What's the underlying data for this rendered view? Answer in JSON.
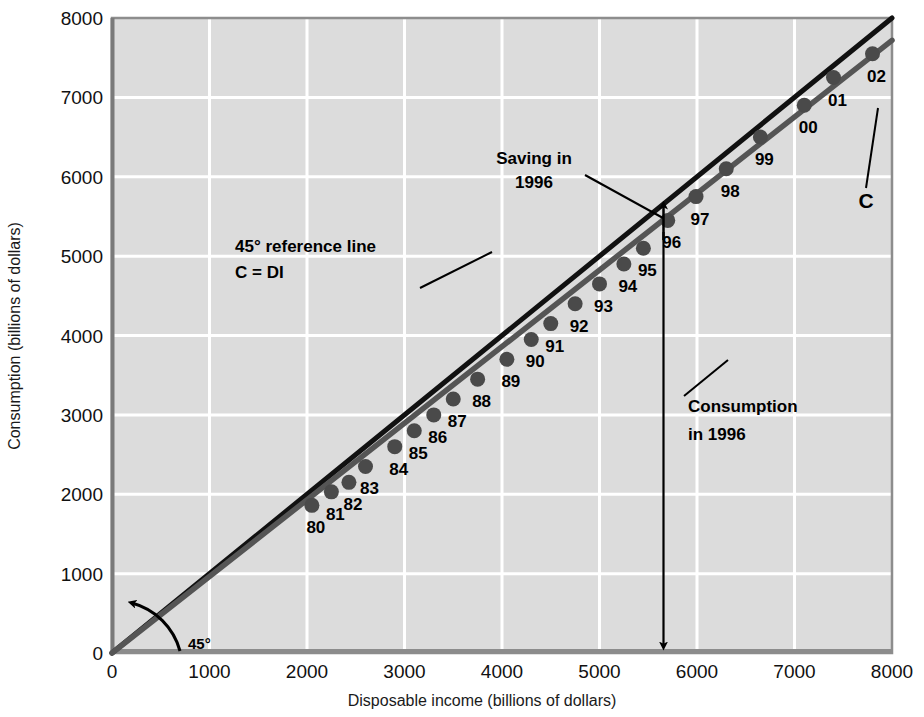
{
  "chart_data": {
    "type": "scatter",
    "title": "",
    "xlabel": "Disposable income (billions of dollars)",
    "ylabel": "Consumption (billions of dollars)",
    "xlim": [
      0,
      8000
    ],
    "ylim": [
      0,
      8000
    ],
    "xticks": [
      0,
      1000,
      2000,
      3000,
      4000,
      5000,
      6000,
      7000,
      8000
    ],
    "yticks": [
      0,
      1000,
      2000,
      3000,
      4000,
      5000,
      6000,
      7000,
      8000
    ],
    "xticklabels": [
      "0",
      "1000",
      "2000",
      "3000",
      "4000",
      "5000",
      "6000",
      "7000",
      "8000"
    ],
    "yticklabels": [
      "0",
      "1000",
      "2000",
      "3000",
      "4000",
      "5000",
      "6000",
      "7000",
      "8000"
    ],
    "grid": true,
    "legend": false,
    "plot_bgcolor": "#dcdcdc",
    "grid_color": "#ffffff",
    "point_color": "#4a4a4a",
    "c_line_color": "#555555",
    "ref_line_color": "#111111",
    "series": [
      {
        "name": "Consumption vs Disposable income",
        "point_labels": [
          "80",
          "81",
          "82",
          "83",
          "84",
          "85",
          "86",
          "87",
          "88",
          "89",
          "90",
          "91",
          "92",
          "93",
          "94",
          "95",
          "96",
          "97",
          "98",
          "99",
          "00",
          "01",
          "02"
        ],
        "x": [
          2050,
          2250,
          2430,
          2600,
          2900,
          3100,
          3300,
          3500,
          3750,
          4050,
          4300,
          4500,
          4750,
          5000,
          5250,
          5450,
          5700,
          5990,
          6300,
          6650,
          7100,
          7400,
          7800
        ],
        "y": [
          1860,
          2030,
          2150,
          2350,
          2600,
          2800,
          3000,
          3200,
          3450,
          3700,
          3950,
          4150,
          4400,
          4650,
          4900,
          5100,
          5450,
          5750,
          6100,
          6500,
          6900,
          7250,
          7550
        ]
      }
    ],
    "reference_line": {
      "label": "45° reference line",
      "equation": "C = DI",
      "slope": 1,
      "intercept": 0,
      "angle_label": "45°"
    },
    "consumption_line": {
      "label": "C",
      "slope": 0.968,
      "intercept": -25
    },
    "annotations": [
      {
        "name": "saving-1996",
        "line1": "Saving in",
        "line2": "1996",
        "target_x": 5700,
        "target_y": 5700
      },
      {
        "name": "reference-line-note",
        "line1": "45° reference line",
        "line2": "C = DI"
      },
      {
        "name": "consumption-1996",
        "line1": "Consumption",
        "line2": "in 1996",
        "target_x": 5700,
        "target_y": 0
      }
    ]
  },
  "axis": {
    "x_title": "Disposable income (billions of dollars)",
    "y_title": "Consumption (billions of dollars)"
  },
  "labels": {
    "saving_line1": "Saving in",
    "saving_line2": "1996",
    "ref_line1": "45° reference line",
    "ref_line2": "C = DI",
    "consumption_line1": "Consumption",
    "consumption_line2": "in 1996",
    "c_curve": "C",
    "angle": "45°"
  }
}
